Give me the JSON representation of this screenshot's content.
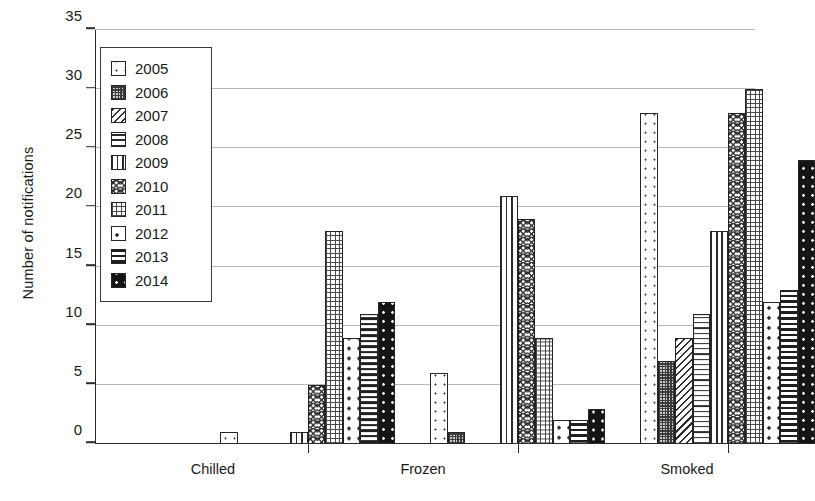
{
  "chart_data": {
    "type": "bar",
    "title": "",
    "xlabel": "",
    "ylabel": "Number of notifications",
    "categories": [
      "Chilled",
      "Frozen",
      "Smoked"
    ],
    "ylim": [
      0,
      35
    ],
    "ytick_labels": [
      "0",
      "5",
      "10",
      "15",
      "20",
      "25",
      "30",
      "35"
    ],
    "ytick_values": [
      0,
      5,
      10,
      15,
      20,
      25,
      30,
      35
    ],
    "grid": true,
    "legend_position": "upper-left-inside",
    "series": [
      {
        "name": "2005",
        "pattern": "sparse-fine-dots",
        "values": [
          1,
          6,
          28
        ]
      },
      {
        "name": "2006",
        "pattern": "dense-checker",
        "values": [
          0,
          1,
          7
        ]
      },
      {
        "name": "2007",
        "pattern": "diagonal-hatch",
        "values": [
          0,
          0,
          9
        ]
      },
      {
        "name": "2008",
        "pattern": "horizontal-lines",
        "values": [
          0,
          0,
          11
        ]
      },
      {
        "name": "2009",
        "pattern": "vertical-lines",
        "values": [
          1,
          21,
          18
        ]
      },
      {
        "name": "2010",
        "pattern": "wave-texture",
        "values": [
          5,
          19,
          28
        ]
      },
      {
        "name": "2011",
        "pattern": "cross-hatch-grid",
        "values": [
          18,
          9,
          30
        ]
      },
      {
        "name": "2012",
        "pattern": "round-dots",
        "values": [
          9,
          2,
          12
        ]
      },
      {
        "name": "2013",
        "pattern": "thick-horiz-bands",
        "values": [
          11,
          2,
          13
        ]
      },
      {
        "name": "2014",
        "pattern": "solid-black-speckle",
        "values": [
          12,
          3,
          24
        ]
      }
    ]
  },
  "legend": {
    "entries": [
      {
        "label": "2005"
      },
      {
        "label": "2006"
      },
      {
        "label": "2007"
      },
      {
        "label": "2008"
      },
      {
        "label": "2009"
      },
      {
        "label": "2010"
      },
      {
        "label": "2011"
      },
      {
        "label": "2012"
      },
      {
        "label": "2013"
      },
      {
        "label": "2014"
      }
    ]
  },
  "colors": {
    "axis": "#2a2a2a",
    "gridline": "#b9b9b9",
    "text": "#1a1a1a",
    "background": "#ffffff",
    "ink": "#242424"
  }
}
